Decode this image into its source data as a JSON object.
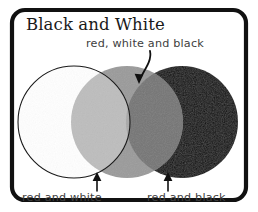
{
  "figure": {
    "title": "Black and White",
    "frame_color": "#111111",
    "background": "#ffffff"
  },
  "labels": {
    "center": "red, white and black",
    "bottom_left": "red and white",
    "bottom_right": "red and black"
  },
  "venn": {
    "circles": [
      {
        "name": "white",
        "fill": "#ffffff",
        "stroke": "#1a1a1a",
        "cx": 74,
        "cy": 122,
        "r": 56
      },
      {
        "name": "red",
        "fill": "#9a9a9a",
        "stroke": "none",
        "cx": 127,
        "cy": 122,
        "r": 56
      },
      {
        "name": "black",
        "fill": "#080808",
        "stroke": "none",
        "cx": 182,
        "cy": 122,
        "r": 56
      }
    ],
    "overlaps": [
      {
        "name": "red-and-white",
        "fill": "#bdbdbd"
      },
      {
        "name": "red-and-black",
        "fill": "#757575"
      },
      {
        "name": "red-white-and-black",
        "fill": "#a8a8a8"
      }
    ]
  },
  "icons": {
    "center_arrow": "curved-down-arrow-icon",
    "left_arrow": "up-arrow-icon",
    "right_arrow": "up-arrow-icon"
  }
}
